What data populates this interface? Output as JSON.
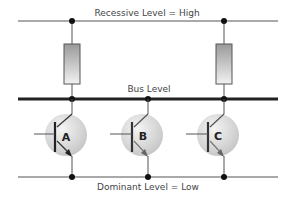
{
  "diagram": {
    "lines": {
      "top": {
        "label": "Recessive Level = High"
      },
      "bus": {
        "label": "Bus Level"
      },
      "bottom": {
        "label": "Dominant Level = Low"
      }
    },
    "resistors": [
      {
        "id": "R1",
        "x": 72
      },
      {
        "id": "R2",
        "x": 224
      }
    ],
    "transistors": [
      {
        "id": "A",
        "label": "A",
        "x": 72
      },
      {
        "id": "B",
        "label": "B",
        "x": 148
      },
      {
        "id": "C",
        "label": "C",
        "x": 224
      }
    ],
    "colors": {
      "line": "#555555",
      "bus": "#222222",
      "resistor_fill_top": "#9a9a9a",
      "resistor_fill_bottom": "#f0f0f0",
      "transistor_fill": "#d8d8d8"
    }
  }
}
